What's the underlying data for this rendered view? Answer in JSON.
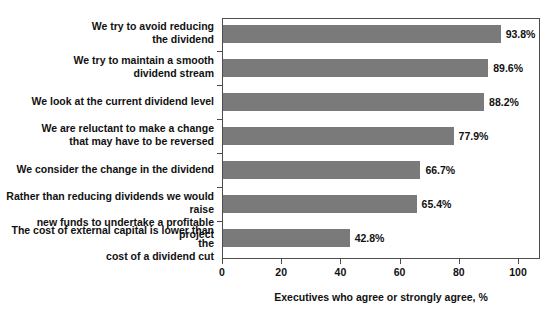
{
  "chart_data": {
    "type": "bar",
    "orientation": "horizontal",
    "title": "",
    "xlabel": "Executives who agree or strongly agree, %",
    "ylabel": "",
    "xlim": [
      0,
      100
    ],
    "xticks": [
      0,
      20,
      40,
      60,
      80,
      100
    ],
    "xtick_labels": [
      "0",
      "20",
      "40",
      "60",
      "80",
      "100"
    ],
    "grid": false,
    "legend": false,
    "bar_color": "#7a7a7a",
    "axis_color": "#4d4d4d",
    "categories": [
      "We try to avoid reducing the dividend",
      "We try to maintain a smooth dividend stream",
      "We look at the current dividend level",
      "We are reluctant to make a change that may have to be reversed",
      "We consider the change in the dividend",
      "Rather than reducing dividends we would raise new funds to undertake a profitable project",
      "The cost of external capital is lower than the cost of a dividend cut"
    ],
    "category_lines": [
      [
        "We try to avoid reducing",
        "the dividend"
      ],
      [
        "We try to maintain a smooth",
        "dividend stream"
      ],
      [
        "We look at the current dividend level"
      ],
      [
        "We are reluctant to make a change",
        "that may have to be reversed"
      ],
      [
        "We consider the change in the dividend"
      ],
      [
        "Rather than reducing dividends we would raise",
        "new funds to undertake a profitable project"
      ],
      [
        "The cost of external capital is lower than the",
        "cost of a dividend cut"
      ]
    ],
    "values": [
      93.8,
      89.6,
      88.2,
      77.9,
      66.7,
      65.4,
      42.8
    ],
    "value_labels": [
      "93.8%",
      "89.6%",
      "88.2%",
      "77.9%",
      "66.7%",
      "65.4%",
      "42.8%"
    ]
  }
}
